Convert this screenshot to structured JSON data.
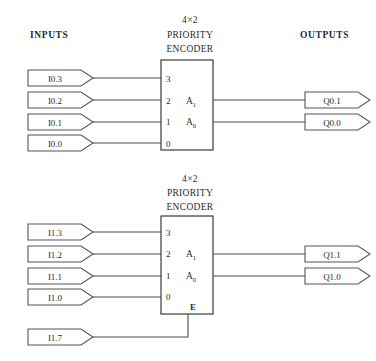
{
  "headers": {
    "inputs": "INPUTS",
    "outputs": "OUTPUTS"
  },
  "encoders": [
    {
      "id": "encoder-top",
      "title_line1": "4×2",
      "title_line2": "PRIORITY",
      "title_line3": "ENCODER",
      "input_pins": [
        "3",
        "2",
        "1",
        "0"
      ],
      "output_pins": [
        {
          "base": "A",
          "sub": "1"
        },
        {
          "base": "A",
          "sub": "0"
        }
      ],
      "enable_pin": null,
      "inputs": [
        "I0.3",
        "I0.2",
        "I0.1",
        "I0.0"
      ],
      "outputs": [
        "Q0.1",
        "Q0.0"
      ]
    },
    {
      "id": "encoder-bottom",
      "title_line1": "4×2",
      "title_line2": "PRIORITY",
      "title_line3": "ENCODER",
      "input_pins": [
        "3",
        "2",
        "1",
        "0"
      ],
      "output_pins": [
        {
          "base": "A",
          "sub": "1"
        },
        {
          "base": "A",
          "sub": "0"
        }
      ],
      "enable_pin": "E",
      "inputs": [
        "I1.3",
        "I1.2",
        "I1.1",
        "I1.0"
      ],
      "enable_input": "I1.7",
      "outputs": [
        "Q1.1",
        "Q1.0"
      ]
    }
  ],
  "colors": {
    "background": "#ffffff",
    "line": "#4a4a4a",
    "box_border": "#3a3a3a",
    "text": "#2b2b2b"
  }
}
